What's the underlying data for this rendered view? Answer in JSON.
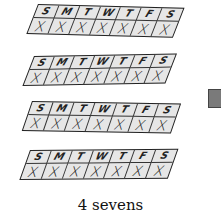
{
  "figure": {
    "caption": "4 sevens",
    "strips": [
      {
        "days": [
          "S",
          "M",
          "T",
          "W",
          "T",
          "F",
          "S"
        ],
        "marks": [
          "X",
          "X",
          "X",
          "X",
          "X",
          "X",
          "X"
        ]
      },
      {
        "days": [
          "S",
          "M",
          "T",
          "W",
          "T",
          "F",
          "S"
        ],
        "marks": [
          "X",
          "X",
          "X",
          "X",
          "X",
          "X",
          "X"
        ]
      },
      {
        "days": [
          "S",
          "M",
          "T",
          "W",
          "T",
          "F",
          "S"
        ],
        "marks": [
          "X",
          "X",
          "X",
          "X",
          "X",
          "X",
          "X"
        ]
      },
      {
        "days": [
          "S",
          "M",
          "T",
          "W",
          "T",
          "F",
          "S"
        ],
        "marks": [
          "X",
          "X",
          "X",
          "X",
          "X",
          "X",
          "X"
        ]
      }
    ],
    "colors": {
      "cell_fill": "#e6e6e6",
      "outline": "#222222",
      "side_block": "#7a7a7a"
    }
  }
}
